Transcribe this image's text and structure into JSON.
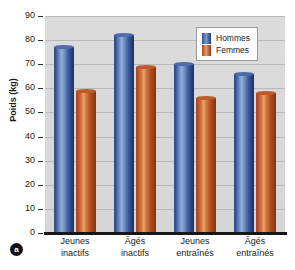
{
  "panel": {
    "label": "a"
  },
  "chart_data": {
    "type": "bar",
    "title": "",
    "xlabel": "",
    "ylabel": "Poids (kg)",
    "ylim": [
      0,
      90
    ],
    "yticks": [
      0,
      10,
      20,
      30,
      40,
      50,
      60,
      70,
      80,
      90
    ],
    "grid": true,
    "legend_position": "top-right",
    "categories": [
      "Jeunes inactifs",
      "Âgés inactifs",
      "Jeunes entraînés",
      "Âgés entraînés"
    ],
    "category_lines": [
      [
        "Jeunes",
        "inactifs"
      ],
      [
        "Âgés",
        "inactifs"
      ],
      [
        "Jeunes",
        "entraînés"
      ],
      [
        "Âgés",
        "entraînés"
      ]
    ],
    "series": [
      {
        "name": "Hommes",
        "color": "#3c5fa4",
        "values": [
          77,
          82,
          70,
          66
        ]
      },
      {
        "name": "Femmes",
        "color": "#c0622c",
        "values": [
          59,
          69,
          56,
          58
        ]
      }
    ]
  }
}
